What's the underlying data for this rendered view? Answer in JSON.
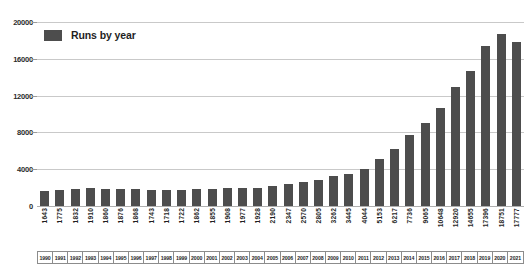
{
  "chart_data": {
    "type": "bar",
    "title": "",
    "subtitle": "",
    "xlabel": "",
    "ylabel": "",
    "ylim": [
      0,
      20000
    ],
    "ytick_values": [
      20000,
      16000,
      12000,
      8000,
      4000,
      0
    ],
    "ytick_labels": [
      "20000",
      "16000",
      "12000",
      "8000",
      "4000",
      "0"
    ],
    "grid": true,
    "legend_position": "top-left",
    "series_name": "Runs by year",
    "bar_color": "#4d4d4d",
    "gridline_color": "#c9c9c9",
    "categories": [
      "1990",
      "1991",
      "1992",
      "1993",
      "1994",
      "1995",
      "1996",
      "1997",
      "1998",
      "1999",
      "2000",
      "2001",
      "2002",
      "2003",
      "2004",
      "2005",
      "2006",
      "2007",
      "2008",
      "2009",
      "2010",
      "2011",
      "2012",
      "2013",
      "2014",
      "2015",
      "2016",
      "2017",
      "2018",
      "2019",
      "2020",
      "2021"
    ],
    "values": [
      1643,
      1775,
      1832,
      1910,
      1860,
      1876,
      1868,
      1743,
      1718,
      1722,
      1862,
      1855,
      1908,
      1977,
      1928,
      2190,
      2347,
      2570,
      2805,
      3262,
      3445,
      4044,
      5153,
      6217,
      7736,
      9065,
      10648,
      12920,
      14655,
      17396,
      18751,
      17777
    ],
    "value_labels": [
      "1643",
      "1775",
      "1832",
      "1910",
      "1860",
      "1876",
      "1868",
      "1743",
      "1718",
      "1722",
      "1862",
      "1855",
      "1908",
      "1977",
      "1928",
      "2190",
      "2347",
      "2570",
      "2805",
      "3262",
      "3445",
      "4044",
      "5153",
      "6217",
      "7736",
      "9065",
      "10648",
      "12920",
      "14655",
      "17396",
      "18751",
      "17777"
    ]
  },
  "legend": {
    "label": "Runs by year"
  }
}
